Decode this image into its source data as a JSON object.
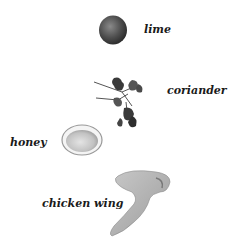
{
  "ingredients": [
    {
      "name": "lime",
      "label": "lime"
    },
    {
      "name": "coriander",
      "label": "coriander"
    },
    {
      "name": "honey",
      "label": "honey"
    },
    {
      "name": "chicken-wing",
      "label": "chicken wing"
    }
  ]
}
